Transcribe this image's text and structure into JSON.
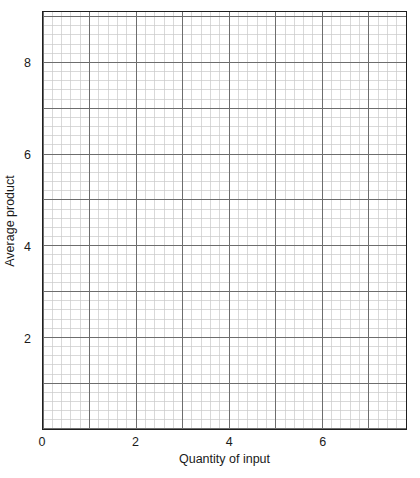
{
  "chart_data": {
    "type": "line",
    "title": "",
    "subtitle": "",
    "xlabel": "Quantity of input",
    "ylabel": "Average product",
    "xlim": [
      0,
      7.8
    ],
    "ylim": [
      0,
      9.1
    ],
    "xticks": [
      0,
      2,
      4,
      6
    ],
    "yticks": [
      2,
      4,
      6,
      8
    ],
    "xtick_labels": [
      "0",
      "2",
      "4",
      "6"
    ],
    "ytick_labels": [
      "2",
      "4",
      "6",
      "8"
    ],
    "grid": true,
    "grid_style": "graph-paper",
    "minor_grid_step": 0.2,
    "major_grid_step": 1,
    "legend": null,
    "legend_position": "none",
    "series": [],
    "annotations": [],
    "note": "Empty graph-paper grid provided for the student to plot the average product curve; no data is drawn."
  },
  "axes": {
    "x": {
      "label": "Quantity of input",
      "ticks": [
        {
          "value": 0,
          "label": "0"
        },
        {
          "value": 2,
          "label": "2"
        },
        {
          "value": 4,
          "label": "4"
        },
        {
          "value": 6,
          "label": "6"
        }
      ]
    },
    "y": {
      "label": "Average product",
      "ticks": [
        {
          "value": 2,
          "label": "2"
        },
        {
          "value": 4,
          "label": "4"
        },
        {
          "value": 6,
          "label": "6"
        },
        {
          "value": 8,
          "label": "8"
        }
      ]
    }
  },
  "colors": {
    "background": "#ffffff",
    "axis_line": "#1f1f1f",
    "grid_minor": "#c9c9c9",
    "grid_major": "#6d6d6d",
    "text": "#1a1a1a"
  }
}
